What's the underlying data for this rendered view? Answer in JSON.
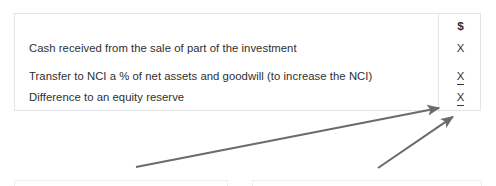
{
  "table": {
    "name": "equity-transaction-workings",
    "amount_header": "$",
    "rows": [
      {
        "description": "",
        "amount": "$",
        "underlined": false,
        "is_header": true
      },
      {
        "description": "Cash received from the sale of part of the investment",
        "amount": "X",
        "underlined": false,
        "is_header": false
      },
      {
        "description": "Transfer to NCI a % of net assets and goodwill (to increase the NCI)",
        "amount": "X",
        "underlined": true,
        "is_header": false
      },
      {
        "description": "Difference to an equity reserve",
        "amount": "X",
        "underlined": true,
        "is_header": false
      }
    ]
  },
  "annotations": {
    "arrows": [
      {
        "name": "arrow-to-total-row",
        "from_x": 136,
        "from_y": 167,
        "to_x": 444,
        "to_y": 107
      },
      {
        "name": "arrow-to-difference-row",
        "from_x": 378,
        "from_y": 168,
        "to_x": 457,
        "to_y": 114
      }
    ],
    "color": "#6b6b6b"
  },
  "partial_boxes": [
    {
      "name": "partial-box-left"
    },
    {
      "name": "partial-box-right"
    }
  ],
  "colors": {
    "border": "#e3e4e6",
    "text": "#2f2f2f",
    "arrow": "#6b6b6b",
    "background": "#ffffff"
  }
}
